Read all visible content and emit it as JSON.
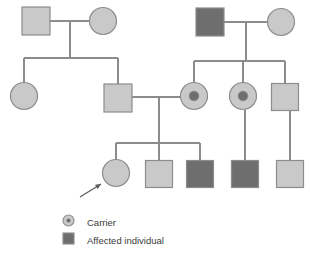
{
  "figure": {
    "kind": "pedigree-chart",
    "width": 310,
    "height": 262,
    "background": "#ffffff"
  },
  "colors": {
    "unaffected_fill": "#c9c9c9",
    "affected_fill": "#6e6e6e",
    "carrier_dot_fill": "#6e6e6e",
    "symbol_stroke": "#8c8c8c",
    "line_stroke": "#8c8c8c",
    "arrow_stroke": "#5a5a5a",
    "legend_text": "#3a3a3a"
  },
  "generations": [
    {
      "id": "generation-1",
      "label": "I",
      "individuals": [
        {
          "id": "I-1",
          "shape": "square",
          "status": "unaffected",
          "sex": "male",
          "cx": 36,
          "cy": 21,
          "size": 28
        },
        {
          "id": "I-2",
          "shape": "circle",
          "status": "unaffected",
          "sex": "female",
          "cx": 103,
          "cy": 21,
          "size": 27
        },
        {
          "id": "I-3",
          "shape": "square",
          "status": "affected",
          "sex": "male",
          "cx": 210,
          "cy": 22,
          "size": 28
        },
        {
          "id": "I-4",
          "shape": "circle",
          "status": "unaffected",
          "sex": "female",
          "cx": 281,
          "cy": 22,
          "size": 27
        }
      ]
    },
    {
      "id": "generation-2",
      "label": "II",
      "individuals": [
        {
          "id": "II-1",
          "shape": "circle",
          "status": "unaffected",
          "sex": "female",
          "cx": 24,
          "cy": 96,
          "size": 27
        },
        {
          "id": "II-2",
          "shape": "square",
          "status": "unaffected",
          "sex": "male",
          "cx": 118,
          "cy": 98,
          "size": 28
        },
        {
          "id": "II-3",
          "shape": "circle",
          "status": "carrier",
          "sex": "female",
          "cx": 194,
          "cy": 96,
          "size": 27
        },
        {
          "id": "II-4",
          "shape": "circle",
          "status": "carrier",
          "sex": "female",
          "cx": 243,
          "cy": 96,
          "size": 27
        },
        {
          "id": "II-5",
          "shape": "square",
          "status": "unaffected",
          "sex": "male",
          "cx": 285,
          "cy": 97,
          "size": 27
        }
      ]
    },
    {
      "id": "generation-3",
      "label": "III",
      "individuals": [
        {
          "id": "III-1",
          "shape": "circle",
          "status": "unaffected",
          "sex": "female",
          "cx": 116,
          "cy": 173,
          "size": 27
        },
        {
          "id": "III-2",
          "shape": "square",
          "status": "unaffected",
          "sex": "male",
          "cx": 159,
          "cy": 174,
          "size": 27
        },
        {
          "id": "III-3",
          "shape": "square",
          "status": "affected",
          "sex": "male",
          "cx": 200,
          "cy": 174,
          "size": 27
        },
        {
          "id": "III-4",
          "shape": "square",
          "status": "affected",
          "sex": "male",
          "cx": 245,
          "cy": 174,
          "size": 27
        },
        {
          "id": "III-5",
          "shape": "square",
          "status": "unaffected",
          "sex": "male",
          "cx": 290,
          "cy": 174,
          "size": 27
        }
      ]
    }
  ],
  "connections": {
    "mating_lines": [
      {
        "id": "mating-I-1-I-2",
        "x1": 50,
        "x2": 89,
        "y": 21
      },
      {
        "id": "mating-I-3-I-4",
        "x1": 224,
        "x2": 268,
        "y": 22
      },
      {
        "id": "mating-II-2-II-3",
        "x1": 132,
        "x2": 181,
        "y": 97
      }
    ],
    "descent_lines": [
      {
        "id": "descent-family-1",
        "x": 70,
        "y1": 21,
        "y2": 58
      },
      {
        "id": "descent-family-2",
        "x": 246,
        "y1": 22,
        "y2": 61
      },
      {
        "id": "descent-family-3",
        "x": 159,
        "y1": 97,
        "y2": 143
      }
    ],
    "sibship_bars": [
      {
        "id": "sibship-family-1",
        "y": 58,
        "x1": 24,
        "x2": 118
      },
      {
        "id": "sibship-family-2",
        "y": 61,
        "x1": 194,
        "x2": 285
      },
      {
        "id": "sibship-family-3",
        "y": 143,
        "x1": 116,
        "x2": 200
      }
    ],
    "child_stems": [
      {
        "id": "stem-II-1",
        "x": 24,
        "y1": 58,
        "y2": 83
      },
      {
        "id": "stem-II-2",
        "x": 118,
        "y1": 58,
        "y2": 85
      },
      {
        "id": "stem-II-3",
        "x": 194,
        "y1": 61,
        "y2": 83
      },
      {
        "id": "stem-II-4",
        "x": 243,
        "y1": 61,
        "y2": 83
      },
      {
        "id": "stem-II-5",
        "x": 285,
        "y1": 61,
        "y2": 84
      },
      {
        "id": "stem-III-1",
        "x": 116,
        "y1": 143,
        "y2": 160
      },
      {
        "id": "stem-III-2",
        "x": 159,
        "y1": 143,
        "y2": 161
      },
      {
        "id": "stem-III-3",
        "x": 200,
        "y1": 143,
        "y2": 161
      },
      {
        "id": "stem-III-4",
        "x": 245,
        "y1": 110,
        "y2": 161
      },
      {
        "id": "stem-III-5",
        "x": 290,
        "y1": 111,
        "y2": 161
      }
    ]
  },
  "proband_arrow": {
    "id": "proband-arrow",
    "points_to": "III-1",
    "x1": 80,
    "y1": 197,
    "x2": 101,
    "y2": 184
  },
  "legend": {
    "items": [
      {
        "id": "legend-carrier",
        "symbol": "carrier-circle-icon",
        "label": "Carrier",
        "symbol_x": 63,
        "symbol_y": 215,
        "symbol_size": 11,
        "text_x": 87,
        "text_y": 226
      },
      {
        "id": "legend-affected",
        "symbol": "affected-square-icon",
        "label": "Affected individual",
        "symbol_x": 63,
        "symbol_y": 233,
        "symbol_size": 11,
        "text_x": 87,
        "text_y": 244
      }
    ]
  }
}
